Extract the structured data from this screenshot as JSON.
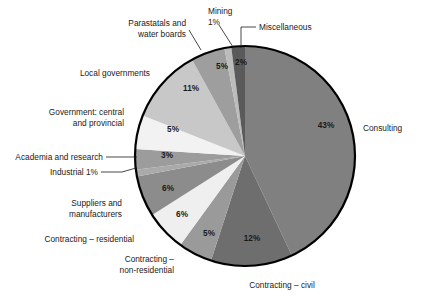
{
  "chart_data": {
    "type": "pie",
    "title": "",
    "subtitle": "",
    "xlabel": "",
    "ylabel": "",
    "legend_position": "outside-labels",
    "grid": false,
    "start_angle_deg": 0,
    "direction": "clockwise",
    "center": {
      "x": 245,
      "y": 156
    },
    "radius": 110,
    "units": "percent",
    "categories": [
      "Consulting",
      "Contracting – civil",
      "Contracting – non-residential",
      "Contracting – residential",
      "Suppliers and manufacturers",
      "Industrial",
      "Academia and research",
      "Government: central and provincial",
      "Local governments",
      "Parastatals and water boards",
      "Mining",
      "Miscellaneous"
    ],
    "values": [
      43,
      12,
      5,
      6,
      6,
      1,
      3,
      5,
      11,
      5,
      1,
      2
    ],
    "value_labels": [
      "43%",
      "12%",
      "5%",
      "6%",
      "6%",
      "1%",
      "3%",
      "5%",
      "11%",
      "5%",
      "1%",
      "2%"
    ],
    "colors": [
      "#808080",
      "#6e6e6e",
      "#9a9a9a",
      "#efefef",
      "#8c8c8c",
      "#aaaaaa",
      "#9c9c9c",
      "#f2f2f2",
      "#c8c8c8",
      "#9e9e9e",
      "#bcbcbc",
      "#5a5a5a"
    ],
    "outline_color": "#000000",
    "background": "#ffffff",
    "text_color": "#1a1a1a"
  },
  "labels": {
    "consulting": "Consulting",
    "contracting_civil": "Contracting – civil",
    "contracting_nonres_line1": "Contracting –",
    "contracting_nonres_line2": "non-residential",
    "contracting_residential": "Contracting – residential",
    "suppliers_line1": "Suppliers and",
    "suppliers_line2": "manufacturers",
    "industrial": "Industrial 1%",
    "academia": "Academia and research",
    "government_line1": "Government: central",
    "government_line2": "and provincial",
    "local_governments": "Local governments",
    "parastatals_line1": "Parastatals and",
    "parastatals_line2": "water boards",
    "mining_line1": "Mining",
    "mining_line2": "1%",
    "miscellaneous": "Miscellaneous"
  },
  "percents": {
    "consulting": "43%",
    "contracting_civil": "12%",
    "contracting_nonres": "5%",
    "contracting_residential": "6%",
    "suppliers": "6%",
    "academia": "3%",
    "government": "5%",
    "local_governments": "11%",
    "parastatals": "5%",
    "miscellaneous": "2%"
  }
}
